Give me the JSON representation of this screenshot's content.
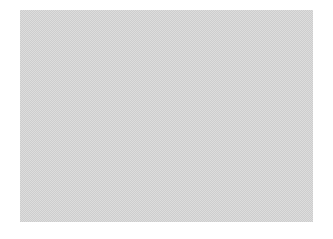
{
  "image_region": {
    "description": "Blank dithered gray placeholder area",
    "fill_colors": [
      "#bdbdbd",
      "#f0f0f0"
    ],
    "bounds": {
      "x": 20,
      "y": 10,
      "width": 293,
      "height": 212
    }
  },
  "background_color": "#ffffff"
}
